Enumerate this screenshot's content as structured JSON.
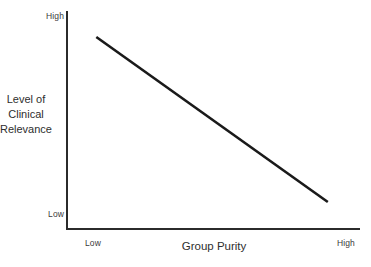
{
  "chart_data": {
    "type": "line",
    "title": "",
    "subtitle": "",
    "xlabel": "Group Purity",
    "ylabel": "Level of Clinical Relevance",
    "ylabel_lines": [
      "Level of",
      "Clinical",
      "Relevance"
    ],
    "x_tick_labels": [
      "Low",
      "High"
    ],
    "y_tick_labels": [
      "High",
      "Low"
    ],
    "xlim": [
      "Low",
      "High"
    ],
    "ylim": [
      "Low",
      "High"
    ],
    "grid": false,
    "legend": false,
    "legend_position": "none",
    "line_color": "#1a1a1a",
    "axis_color": "#2b2b2b",
    "background_color": "#ffffff",
    "series": [
      {
        "name": "Clinical relevance trend",
        "x": [
          0.1,
          0.89
        ],
        "y": [
          0.88,
          0.12
        ],
        "points": [
          {
            "x_label": "near Low",
            "y_label": "near High",
            "x": 0.1,
            "y": 0.88
          },
          {
            "x_label": "near High",
            "y_label": "near Low",
            "x": 0.89,
            "y": 0.12
          }
        ],
        "relationship": "negative linear"
      }
    ],
    "annotations": []
  },
  "figure": {
    "y_axis": {
      "title_lines": [
        "Level of",
        "Clinical",
        "Relevance"
      ],
      "tick_high": "High",
      "tick_low": "Low"
    },
    "x_axis": {
      "title": "Group Purity",
      "tick_low": "Low",
      "tick_high": "High"
    }
  }
}
